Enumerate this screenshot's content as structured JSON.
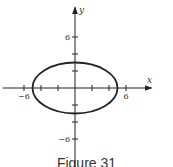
{
  "chart_data": {
    "type": "line",
    "title": "",
    "caption": "Figure 31",
    "xlabel": "x",
    "ylabel": "y",
    "xlim": [
      -8.5,
      9
    ],
    "ylim": [
      -9.5,
      9.5
    ],
    "x_ticks": [
      -6,
      -4,
      -2,
      2,
      4,
      6
    ],
    "y_ticks": [
      -6,
      -4,
      -2,
      2,
      4,
      6
    ],
    "x_tick_labels": [
      {
        "value": -6,
        "label": "−6"
      },
      {
        "value": 6,
        "label": "6"
      }
    ],
    "y_tick_labels": [
      {
        "value": 6,
        "label": "6"
      },
      {
        "value": -6,
        "label": "−6"
      }
    ],
    "grid": false,
    "series": [
      {
        "name": "ellipse",
        "shape": "ellipse",
        "center": [
          0,
          0
        ],
        "semi_major_x": 5,
        "semi_minor_y": 3,
        "color": "#222222"
      }
    ]
  }
}
